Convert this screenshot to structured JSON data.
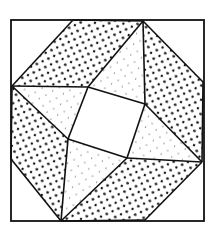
{
  "diagram": {
    "title": "",
    "colors": {
      "line": "#111111",
      "background": "#ffffff",
      "dot": "#111111"
    },
    "patches": [
      {
        "name": "top-dense-patch",
        "fill": "dense-dots"
      },
      {
        "name": "right-dense-patch",
        "fill": "dense-dots"
      },
      {
        "name": "bottom-dense-patch",
        "fill": "dense-dots"
      },
      {
        "name": "left-dense-patch",
        "fill": "dense-dots"
      },
      {
        "name": "top-light-triangle",
        "fill": "sparse-dots"
      },
      {
        "name": "right-light-triangle",
        "fill": "sparse-dots"
      },
      {
        "name": "bottom-light-triangle",
        "fill": "sparse-dots"
      },
      {
        "name": "left-light-triangle",
        "fill": "sparse-dots"
      },
      {
        "name": "center-square",
        "fill": "plain"
      },
      {
        "name": "corner-top-left",
        "fill": "plain"
      },
      {
        "name": "corner-top-right",
        "fill": "plain"
      },
      {
        "name": "corner-bottom-right",
        "fill": "plain"
      },
      {
        "name": "corner-bottom-left",
        "fill": "plain"
      }
    ]
  }
}
